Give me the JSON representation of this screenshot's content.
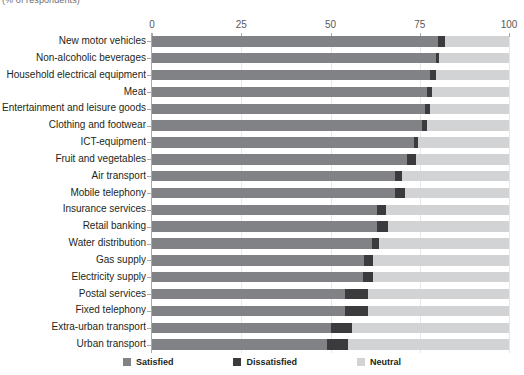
{
  "subtitle": "(% of respondents)",
  "axis": {
    "ticks": [
      "0",
      "25",
      "50",
      "75",
      "100"
    ]
  },
  "legend": {
    "items": [
      {
        "label": "Satisfied",
        "color": "#808285",
        "swatch": "satisfied-swatch"
      },
      {
        "label": "Dissatisfied",
        "color": "#3b3b3d",
        "swatch": "dissatisfied-swatch"
      },
      {
        "label": "Neutral",
        "color": "#d1d3d4",
        "swatch": "neutral-swatch"
      }
    ]
  },
  "chart_data": {
    "type": "bar",
    "orientation": "horizontal",
    "stacked": true,
    "title": "",
    "subtitle": "(% of respondents)",
    "xlabel": "",
    "ylabel": "",
    "xlim": [
      0,
      100
    ],
    "xticks": [
      0,
      25,
      50,
      75,
      100
    ],
    "grid": true,
    "legend_position": "bottom",
    "categories": [
      "New motor vehicles",
      "Non-alcoholic beverages",
      "Household electrical equipment",
      "Meat",
      "Entertainment and leisure goods",
      "Clothing and footwear",
      "ICT-equipment",
      "Fruit and vegetables",
      "Air transport",
      "Mobile telephony",
      "Insurance services",
      "Retail banking",
      "Water distribution",
      "Gas supply",
      "Electricity supply",
      "Postal services",
      "Fixed telephony",
      "Extra-urban transport",
      "Urban transport"
    ],
    "series": [
      {
        "name": "Satisfied",
        "color": "#808285",
        "values": [
          80,
          79.5,
          78,
          77,
          76.5,
          75.5,
          73.5,
          71.5,
          68,
          68,
          63,
          63,
          61.5,
          59.5,
          59,
          54,
          54,
          50,
          49
        ]
      },
      {
        "name": "Dissatisfied",
        "color": "#3b3b3d",
        "values": [
          2,
          1,
          1.5,
          1.5,
          1.5,
          1.5,
          1,
          2.5,
          2,
          3,
          2.5,
          3,
          2,
          2.5,
          3,
          6.5,
          6.5,
          6,
          6
        ]
      },
      {
        "name": "Neutral",
        "color": "#d1d3d4",
        "values": [
          18,
          19.5,
          20.5,
          21.5,
          22,
          23,
          25.5,
          26,
          30,
          29,
          34.5,
          34,
          36.5,
          38,
          38,
          39.5,
          39.5,
          44,
          45
        ]
      }
    ]
  }
}
